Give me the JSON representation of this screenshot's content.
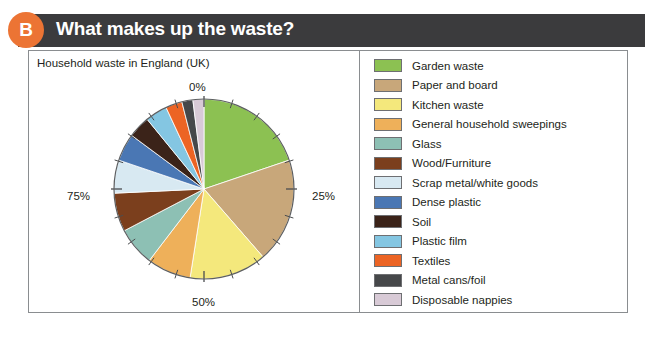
{
  "header": {
    "badge": "B",
    "title": "What makes up the waste?"
  },
  "chart_data": {
    "type": "pie",
    "title": "Household waste in England (UK)",
    "xlabel": "",
    "ylabel": "",
    "axis_tick_labels": [
      "0%",
      "25%",
      "50%",
      "75%"
    ],
    "legend_position": "right",
    "grid": false,
    "categories": [
      "Garden waste",
      "Paper and board",
      "Kitchen waste",
      "General household sweepings",
      "Glass",
      "Wood/Furniture",
      "Scrap metal/white goods",
      "Dense plastic",
      "Soil",
      "Plastic film",
      "Textiles",
      "Metal cans/foil",
      "Disposable nappies"
    ],
    "values": [
      20,
      19,
      14,
      8,
      7,
      7,
      6,
      5,
      4,
      4,
      3,
      2,
      2
    ],
    "colors": [
      "#8cc152",
      "#c8a77a",
      "#f4e87c",
      "#eeb05a",
      "#8dc0b4",
      "#7b3f1d",
      "#d8e9f2",
      "#4a77b4",
      "#3b2319",
      "#84c6e2",
      "#ec6424",
      "#46484a",
      "#d8cad6"
    ]
  },
  "legend": {
    "items": [
      {
        "label": "Garden waste",
        "color": "#8cc152"
      },
      {
        "label": "Paper and board",
        "color": "#c8a77a"
      },
      {
        "label": "Kitchen waste",
        "color": "#f4e87c"
      },
      {
        "label": "General household sweepings",
        "color": "#eeb05a"
      },
      {
        "label": "Glass",
        "color": "#8dc0b4"
      },
      {
        "label": "Wood/Furniture",
        "color": "#7b3f1d"
      },
      {
        "label": "Scrap metal/white goods",
        "color": "#d8e9f2"
      },
      {
        "label": "Dense plastic",
        "color": "#4a77b4"
      },
      {
        "label": "Soil",
        "color": "#3b2319"
      },
      {
        "label": "Plastic film",
        "color": "#84c6e2"
      },
      {
        "label": "Textiles",
        "color": "#ec6424"
      },
      {
        "label": "Metal cans/foil",
        "color": "#46484a"
      },
      {
        "label": "Disposable nappies",
        "color": "#d8cad6"
      }
    ]
  }
}
